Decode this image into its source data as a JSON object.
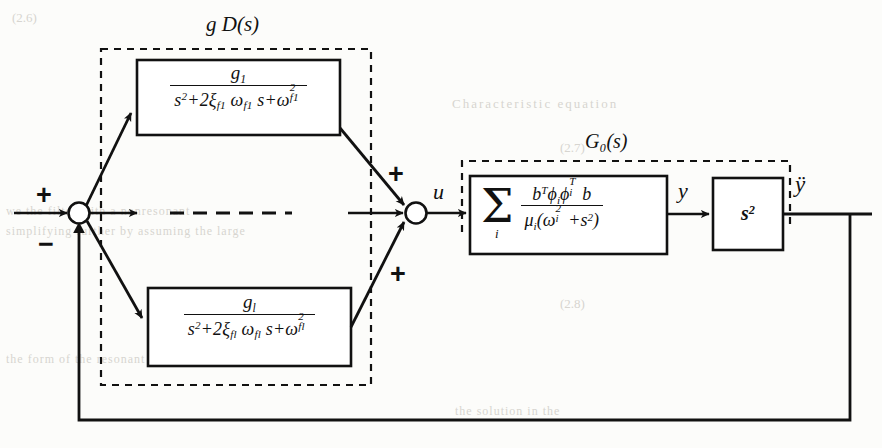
{
  "figure": {
    "type": "control-block-diagram"
  },
  "labels": {
    "controller_group": "g D(s)",
    "plant_group": "G₀(s)",
    "signal_u": "u",
    "signal_y": "y",
    "signal_ydd": "ÿ",
    "sum_left_plus": "+",
    "sum_left_minus": "−",
    "sum_right_plus_top": "+",
    "sum_right_plus_bottom": "+"
  },
  "blocks": {
    "filter_first": {
      "numerator": "g₁",
      "denominator": "s²+2ξ_f1 ω_f1 s+ω²_f1",
      "num_parts": {
        "base": "g",
        "sub": "1"
      },
      "den_parts": {
        "s2": "s",
        "s2sup": "2",
        "two_xi": "+2ξ",
        "xi_sub": "f1",
        "omega": "ω",
        "omega_sub": "f1",
        "s_mid": "s+",
        "omega2": "ω",
        "omega2_sup": "2",
        "omega2_sub": "f1"
      }
    },
    "filter_last": {
      "numerator": "g_l",
      "denominator": "s²+2ξ_fl ω_fl s+ω²_fl",
      "num_parts": {
        "base": "g",
        "sub": "l"
      },
      "den_parts": {
        "s2": "s",
        "s2sup": "2",
        "two_xi": "+2ξ",
        "xi_sub": "fl",
        "omega": "ω",
        "omega_sub": "fl",
        "s_mid": "s+",
        "omega2": "ω",
        "omega2_sup": "2",
        "omega2_sub": "fl"
      }
    },
    "plant": {
      "sigma": "Σ",
      "sigma_sub": "i",
      "numerator": "bᵀϕᵢϕᵢᵀb",
      "denominator": "μᵢ(ωᵢ²+s²)",
      "num_parts": {
        "b1": "b",
        "b1sup": "T",
        "phi1": "ϕ",
        "phi1sub": "i",
        "phi2": "ϕ",
        "phi2sub": "i",
        "phi2sup": "T",
        "b2": "b"
      },
      "den_parts": {
        "mu": "μ",
        "mu_sub": "i",
        "open": "(",
        "omega": "ω",
        "omega_sub": "i",
        "omega_sup": "2",
        "plus": "+",
        "s": "s",
        "s_sup": "2",
        "close": ")"
      }
    },
    "differentiator": {
      "base": "s",
      "exponent": "2",
      "label": "s²"
    },
    "ellipsis_row": "— — — — —"
  },
  "colors": {
    "ink": "#111111",
    "paper": "#fcfcfa",
    "ghost_text": "#b9b6ae"
  },
  "background_bleed": [
    "(2.6)",
    "Characteristic  equation",
    "(2.7)",
    "(2.8)",
    "we   the     filter   with     a    nonresonant",
    "simplifying    further      by     assuming    the  large",
    "the   form   of   the   resonant   filter   with   the   notch",
    "where the system     there",
    "the    solution  in  the"
  ]
}
